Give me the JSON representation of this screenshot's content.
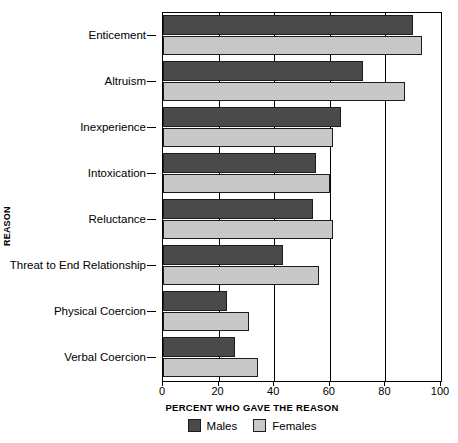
{
  "chart_data": {
    "type": "bar",
    "orientation": "horizontal",
    "title": "",
    "xlabel": "PERCENT WHO GAVE THE REASON",
    "ylabel": "REASON",
    "xlim": [
      0,
      100
    ],
    "xticks": [
      0,
      20,
      40,
      60,
      80,
      100
    ],
    "xtick_labels": [
      "0",
      "20",
      "40",
      "60",
      "80",
      "100"
    ],
    "grid": true,
    "legend_position": "bottom-center",
    "categories": [
      "Enticement",
      "Altruism",
      "Inexperience",
      "Intoxication",
      "Reluctance",
      "Threat to End Relationship",
      "Physical Coercion",
      "Verbal Coercion"
    ],
    "series": [
      {
        "name": "Males",
        "color": "#4a4a4a",
        "values": [
          90,
          72,
          64,
          55,
          54,
          43,
          23,
          26
        ]
      },
      {
        "name": "Females",
        "color": "#c8c8c8",
        "values": [
          93,
          87,
          61,
          60,
          61,
          56,
          31,
          34
        ]
      }
    ]
  },
  "colors": {
    "males": "#4a4a4a",
    "females": "#c8c8c8",
    "axis": "#000000",
    "background": "#ffffff"
  }
}
